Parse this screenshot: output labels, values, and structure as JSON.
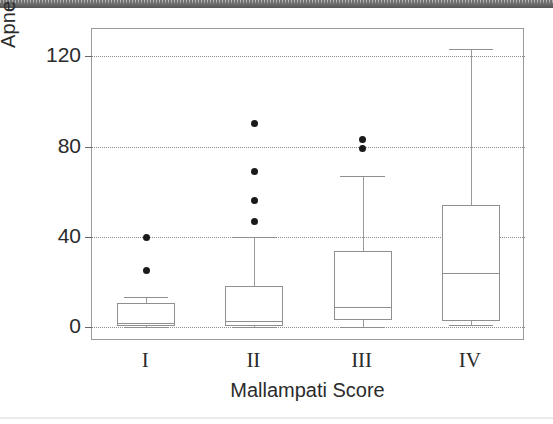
{
  "figure": {
    "y_axis_title": "Apnea Hypopnea Index",
    "x_axis_title": "Mallampati Score"
  },
  "chart_data": {
    "type": "box",
    "title": "",
    "xlabel": "Mallampati Score",
    "ylabel": "Apnea Hypopnea Index",
    "categories": [
      "I",
      "II",
      "III",
      "IV"
    ],
    "ylim": [
      -6,
      132
    ],
    "yticks": [
      0,
      40,
      80,
      120
    ],
    "ytick_labels": [
      "0",
      "40",
      "80",
      "120"
    ],
    "grid": "horizontal-dotted",
    "legend": "none",
    "boxes": [
      {
        "category": "I",
        "whisker_low": 0,
        "q1": 0.5,
        "median": 2,
        "q3": 11,
        "whisker_high": 13.5,
        "outliers": [
          40,
          25
        ]
      },
      {
        "category": "II",
        "whisker_low": 0,
        "q1": 0.5,
        "median": 3,
        "q3": 18.5,
        "whisker_high": 40,
        "outliers": [
          90,
          69,
          56,
          47
        ]
      },
      {
        "category": "III",
        "whisker_low": 0,
        "q1": 3.5,
        "median": 9,
        "q3": 34,
        "whisker_high": 67,
        "outliers": [
          83,
          79
        ]
      },
      {
        "category": "IV",
        "whisker_low": 1,
        "q1": 3,
        "median": 24,
        "q3": 54,
        "whisker_high": 123,
        "outliers": []
      }
    ]
  },
  "colors": {
    "axis": "#9a9a9a",
    "gridline": "#8c8c8c",
    "box_stroke": "#8f8f8f",
    "outlier": "#1a1a1a",
    "text": "#2b2b2b",
    "scan_band": "#6e6e6e"
  }
}
